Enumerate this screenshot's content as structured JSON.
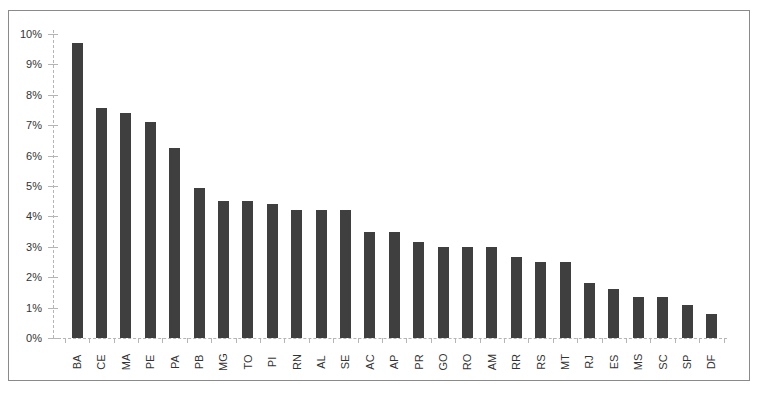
{
  "chart_data": {
    "type": "bar",
    "title": "",
    "xlabel": "",
    "ylabel": "",
    "ylim": [
      0,
      10
    ],
    "y_ticks": [
      "0%",
      "1%",
      "2%",
      "3%",
      "4%",
      "5%",
      "6%",
      "7%",
      "8%",
      "9%",
      "10%"
    ],
    "grid": false,
    "legend": null,
    "bar_color": "#3f3f3f",
    "categories": [
      "BA",
      "CE",
      "MA",
      "PE",
      "PA",
      "PB",
      "MG",
      "TO",
      "PI",
      "RN",
      "AL",
      "SE",
      "AC",
      "AP",
      "PR",
      "GO",
      "RO",
      "AM",
      "RR",
      "RS",
      "MT",
      "RJ",
      "ES",
      "MS",
      "SC",
      "SP",
      "DF"
    ],
    "values": [
      9.7,
      7.55,
      7.4,
      7.1,
      6.25,
      4.95,
      4.5,
      4.5,
      4.4,
      4.2,
      4.2,
      4.2,
      3.5,
      3.5,
      3.15,
      3.0,
      3.0,
      3.0,
      2.65,
      2.5,
      2.5,
      1.8,
      1.6,
      1.35,
      1.35,
      1.1,
      0.8
    ],
    "value_format": "percent"
  }
}
